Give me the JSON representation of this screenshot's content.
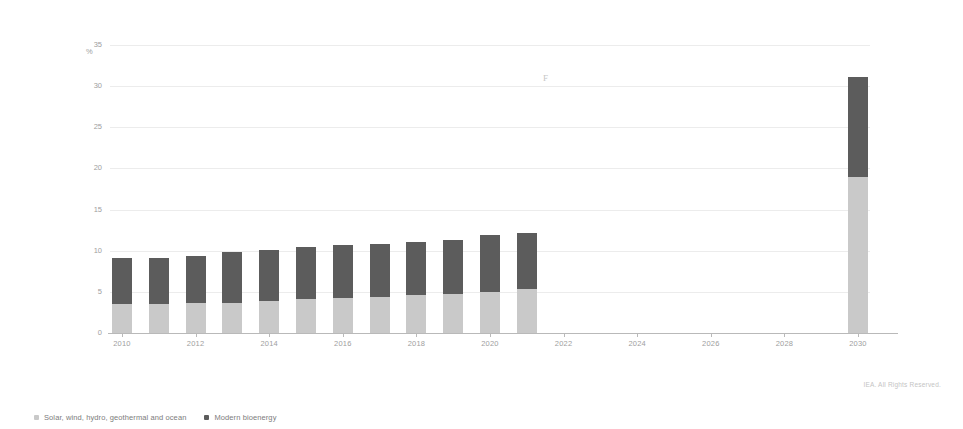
{
  "chart_data": {
    "type": "bar",
    "stacked": true,
    "title": "",
    "subtitle": "",
    "xlabel": "",
    "ylabel": "%",
    "unit_label": "%",
    "ylim": [
      0,
      35
    ],
    "ytick_labels": [
      "0",
      "5",
      "10",
      "15",
      "20",
      "25",
      "30",
      "35"
    ],
    "ytick_values": [
      0,
      5,
      10,
      15,
      20,
      25,
      30,
      35
    ],
    "grid": true,
    "grid_axis": "y",
    "legend_position": "bottom-left",
    "categories": [
      "2010",
      "2011",
      "2012",
      "2013",
      "2014",
      "2015",
      "2016",
      "2017",
      "2018",
      "2019",
      "2020",
      "2021",
      "2030"
    ],
    "xtick_labels": [
      "2010",
      "2012",
      "2014",
      "2016",
      "2018",
      "2020",
      "2022",
      "2024",
      "2026",
      "2028",
      "2030"
    ],
    "series": [
      {
        "name": "Modern bioenergy",
        "color": "#c9c9c9",
        "values": [
          3.5,
          3.5,
          3.6,
          3.7,
          3.9,
          4.1,
          4.2,
          4.4,
          4.6,
          4.7,
          5.0,
          5.3,
          18.9
        ]
      },
      {
        "name": "Solar, wind, hydro, geothermal and ocean",
        "color": "#5c5c5c",
        "values": [
          5.6,
          5.6,
          5.8,
          6.1,
          6.2,
          6.4,
          6.5,
          6.4,
          6.5,
          6.6,
          6.9,
          6.9,
          12.2
        ]
      }
    ],
    "totals": [
      9.1,
      9.1,
      9.4,
      9.8,
      10.1,
      10.5,
      10.7,
      10.8,
      11.1,
      11.3,
      11.9,
      12.2,
      31.1
    ],
    "annotations": []
  },
  "legend": {
    "items": [
      {
        "label": "Solar, wind, hydro, geothermal and ocean",
        "color": "#c9c9c9"
      },
      {
        "label": "Modern bioenergy",
        "color": "#5c5c5c"
      }
    ]
  },
  "credit": {
    "text": "IEA. All Rights Reserved."
  },
  "artifact": {
    "mark": "F"
  }
}
